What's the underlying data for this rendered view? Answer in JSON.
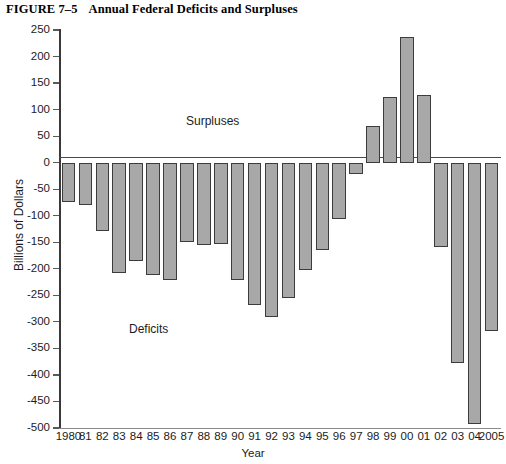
{
  "figure": {
    "number": "FIGURE 7–5",
    "title": "Annual Federal Deficits and Surpluses"
  },
  "annotations": {
    "surpluses": "Surpluses",
    "deficits": "Deficits"
  },
  "chart_data": {
    "type": "bar",
    "title": "Annual Federal Deficits and Surpluses",
    "xlabel": "Year",
    "ylabel": "Billions of Dollars",
    "ylim": [
      -500,
      250
    ],
    "ytick_step": 50,
    "grid": false,
    "legend": null,
    "bar_color": "#a8a8a8",
    "bar_edge_color": "#3c3c3c",
    "ytick_labels": [
      "250",
      "200",
      "150",
      "100",
      "50",
      "0",
      "-50",
      "-100",
      "-150",
      "-200",
      "-250",
      "-300",
      "-350",
      "-400",
      "-450",
      "-500"
    ],
    "ytick_values": [
      250,
      200,
      150,
      100,
      50,
      0,
      -50,
      -100,
      -150,
      -200,
      -250,
      -300,
      -350,
      -400,
      -450,
      -500
    ],
    "categories": [
      "1980",
      "81",
      "82",
      "83",
      "84",
      "85",
      "86",
      "87",
      "88",
      "89",
      "90",
      "91",
      "92",
      "93",
      "94",
      "95",
      "96",
      "97",
      "98",
      "99",
      "00",
      "01",
      "02",
      "03",
      "04",
      "2005"
    ],
    "values": [
      -74,
      -79,
      -128,
      -208,
      -185,
      -212,
      -221,
      -150,
      -155,
      -153,
      -221,
      -269,
      -290,
      -255,
      -203,
      -164,
      -107,
      -22,
      69,
      124,
      236,
      127,
      -158,
      -378,
      -493,
      -318
    ],
    "annotations": [
      {
        "text": "Surpluses",
        "x": "1989",
        "y": 60
      },
      {
        "text": "Deficits",
        "x": "1984",
        "y": -310
      }
    ]
  }
}
